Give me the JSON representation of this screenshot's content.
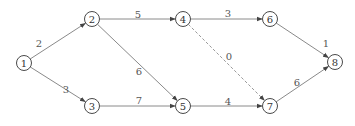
{
  "diagram": {
    "type": "activity-network",
    "nodes": [
      {
        "id": "1",
        "label": "1",
        "x": 24,
        "y": 63
      },
      {
        "id": "2",
        "label": "2",
        "x": 92,
        "y": 19
      },
      {
        "id": "3",
        "label": "3",
        "x": 92,
        "y": 106
      },
      {
        "id": "4",
        "label": "4",
        "x": 183,
        "y": 19
      },
      {
        "id": "5",
        "label": "5",
        "x": 183,
        "y": 106
      },
      {
        "id": "6",
        "label": "6",
        "x": 270,
        "y": 19
      },
      {
        "id": "7",
        "label": "7",
        "x": 270,
        "y": 106
      },
      {
        "id": "8",
        "label": "8",
        "x": 335,
        "y": 62
      }
    ],
    "edges": [
      {
        "from": "1",
        "to": "2",
        "weight": "2",
        "dashed": false,
        "lx": 39,
        "ly": 43
      },
      {
        "from": "1",
        "to": "3",
        "weight": "3",
        "dashed": false,
        "lx": 66,
        "ly": 89
      },
      {
        "from": "2",
        "to": "4",
        "weight": "5",
        "dashed": false,
        "lx": 138,
        "ly": 14
      },
      {
        "from": "2",
        "to": "5",
        "weight": "6",
        "dashed": false,
        "lx": 139,
        "ly": 71
      },
      {
        "from": "3",
        "to": "5",
        "weight": "7",
        "dashed": false,
        "lx": 139,
        "ly": 100
      },
      {
        "from": "4",
        "to": "6",
        "weight": "3",
        "dashed": false,
        "lx": 228,
        "ly": 13
      },
      {
        "from": "4",
        "to": "7",
        "weight": "0",
        "dashed": true,
        "lx": 229,
        "ly": 56
      },
      {
        "from": "5",
        "to": "7",
        "weight": "4",
        "dashed": false,
        "lx": 228,
        "ly": 101
      },
      {
        "from": "6",
        "to": "8",
        "weight": "1",
        "dashed": false,
        "lx": 326,
        "ly": 43
      },
      {
        "from": "7",
        "to": "8",
        "weight": "6",
        "dashed": false,
        "lx": 297,
        "ly": 82
      }
    ]
  }
}
